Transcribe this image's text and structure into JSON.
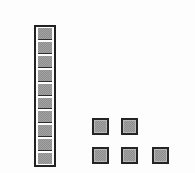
{
  "diagram": {
    "kind": "base-ten-blocks",
    "background_color": "#fdfdfd",
    "block_fill_color": "#a3a3a3",
    "block_border_color": "#2b2b2b",
    "canvas": {
      "width": 195,
      "height": 173
    },
    "ten_rod": {
      "name": "ten-rod",
      "unit_count": 10,
      "x": 34,
      "y": 25,
      "width": 22,
      "height": 142,
      "units": [
        {
          "index": 1
        },
        {
          "index": 2
        },
        {
          "index": 3
        },
        {
          "index": 4
        },
        {
          "index": 5
        },
        {
          "index": 6
        },
        {
          "index": 7
        },
        {
          "index": 8
        },
        {
          "index": 9
        },
        {
          "index": 10
        }
      ]
    },
    "loose_units": {
      "name": "loose-unit-group",
      "count": 5,
      "rows": [
        {
          "row_index": 1,
          "count": 2,
          "squares": [
            {
              "index": 1,
              "x": 92,
              "y": 118,
              "size": 17
            },
            {
              "index": 2,
              "x": 121,
              "y": 118,
              "size": 17
            }
          ]
        },
        {
          "row_index": 2,
          "count": 3,
          "squares": [
            {
              "index": 3,
              "x": 92,
              "y": 147,
              "size": 17
            },
            {
              "index": 4,
              "x": 121,
              "y": 147,
              "size": 17
            },
            {
              "index": 5,
              "x": 152,
              "y": 147,
              "size": 17
            }
          ]
        }
      ]
    },
    "total_units": 15
  }
}
